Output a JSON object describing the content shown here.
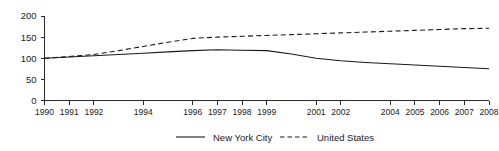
{
  "chart_data": {
    "type": "line",
    "title": "",
    "subtitle": "",
    "xlabel": "",
    "ylabel": "",
    "ylim": [
      0,
      200
    ],
    "yticks": [
      0,
      50,
      100,
      150,
      200
    ],
    "ytick_labels": [
      "0",
      "50",
      "100",
      "150",
      "200"
    ],
    "grid": false,
    "legend_position": "bottom-center",
    "x": [
      1990,
      1991,
      1992,
      1993,
      1994,
      1995,
      1996,
      1997,
      1998,
      1999,
      2000,
      2001,
      2002,
      2003,
      2004,
      2005,
      2006,
      2007,
      2008
    ],
    "xtick_labels": [
      "1990",
      "1991",
      "1992",
      "",
      "1994",
      "",
      "1996",
      "1997",
      "1998",
      "1999",
      "",
      "2001",
      "2002",
      "",
      "2004",
      "2005",
      "2006",
      "2007",
      "2008"
    ],
    "series": [
      {
        "name": "New York City",
        "style": "solid",
        "color": "#1a1a1a",
        "values": [
          100,
          103,
          106,
          109,
          112,
          115,
          118,
          120,
          119,
          118,
          110,
          100,
          94,
          90,
          87,
          84,
          81,
          78,
          75
        ]
      },
      {
        "name": "United States",
        "style": "dashed",
        "color": "#1a1a1a",
        "values": [
          100,
          104,
          109,
          118,
          128,
          138,
          147,
          150,
          152,
          154,
          156,
          158,
          160,
          162,
          164,
          166,
          168,
          170,
          171
        ]
      }
    ]
  },
  "legend": {
    "items": [
      {
        "label": "New York City",
        "style": "solid"
      },
      {
        "label": "United States",
        "style": "dashed"
      }
    ]
  }
}
